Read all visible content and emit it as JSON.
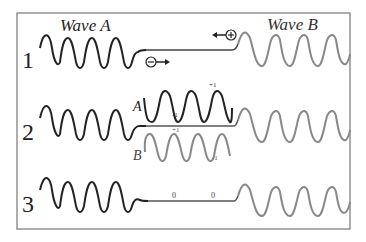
{
  "diagram": {
    "frame": {
      "stroke": "#777777"
    },
    "colors": {
      "wave_a": "#222222",
      "wave_b": "#888888",
      "line_mid": "#555555"
    },
    "wave_a_title": "Wave A",
    "wave_b_title": "Wave B",
    "rows": [
      {
        "number": "1",
        "neg_sign": "−",
        "pos_sign": "+"
      },
      {
        "number": "2",
        "label_a": "A",
        "label_b": "B",
        "a_plus": "+1",
        "a_minus": "-1",
        "b_plus": "+1",
        "b_minus": "-1"
      },
      {
        "number": "3",
        "zero_left": "0",
        "zero_right": "0"
      }
    ]
  }
}
